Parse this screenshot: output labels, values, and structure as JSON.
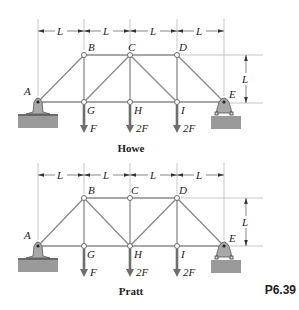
{
  "figure_id": "P6.39",
  "dimension_label": "L",
  "trusses": [
    {
      "name": "Howe",
      "top_y": 55,
      "bottom_y": 102,
      "dim_y": 31,
      "ext_top": 19,
      "joints": {
        "A": "A",
        "B": "B",
        "C": "C",
        "D": "D",
        "E": "E",
        "G": "G",
        "H": "H",
        "I": "I"
      },
      "loads": [
        {
          "joint": "G",
          "label": "F"
        },
        {
          "joint": "H",
          "label": "2F"
        },
        {
          "joint": "I",
          "label": "2F"
        }
      ],
      "dimensions": {
        "horizontal": [
          "L",
          "L",
          "L",
          "L"
        ],
        "vertical": "L"
      }
    },
    {
      "name": "Pratt",
      "top_y": 198,
      "bottom_y": 246,
      "dim_y": 175,
      "ext_top": 163,
      "joints": {
        "A": "A",
        "B": "B",
        "C": "C",
        "D": "D",
        "E": "E",
        "G": "G",
        "H": "H",
        "I": "I"
      },
      "loads": [
        {
          "joint": "G",
          "label": "F"
        },
        {
          "joint": "H",
          "label": "2F"
        },
        {
          "joint": "I",
          "label": "2F"
        }
      ],
      "dimensions": {
        "horizontal": [
          "L",
          "L",
          "L",
          "L"
        ],
        "vertical": "L"
      }
    }
  ]
}
